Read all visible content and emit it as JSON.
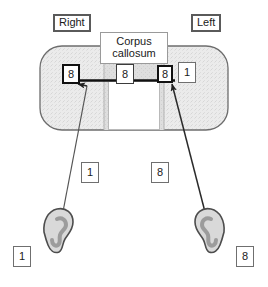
{
  "figure": {
    "type": "anatomical-schematic"
  },
  "colors": {
    "brain_fill": "#e9e9e9",
    "brain_stroke": "#6d6d6d",
    "corpus_fill": "#dcdcdc",
    "line": "#2a2a2a",
    "thick_line": "#111111",
    "ear_outline": "#4d4d4d",
    "ear_fill": "#d7d7d7",
    "ear_inner": "#9c9c9c",
    "box_border_dark": "#111111",
    "box_border_gray": "#6f6f6f",
    "caption_border": "#5a5a5a"
  },
  "labels": {
    "hemisphere_right": "Right",
    "hemisphere_left": "Left",
    "corpus_callosum_line1": "Corpus",
    "corpus_callosum_line2": "callosum"
  },
  "brain_values": {
    "right_hemisphere_box": "8",
    "corpus_callosum_box": "8",
    "left_hemisphere_box_a": "8",
    "left_hemisphere_box_b": "1"
  },
  "pathway_values": {
    "left_pathway": "1",
    "right_pathway": "8"
  },
  "ear_values": {
    "left_ear_box": "1",
    "right_ear_box": "8"
  },
  "icons": {
    "left_ear": "ear-icon",
    "right_ear": "ear-icon",
    "arrow_left": "arrow-up-left-icon",
    "arrow_right": "arrow-up-right-icon"
  }
}
